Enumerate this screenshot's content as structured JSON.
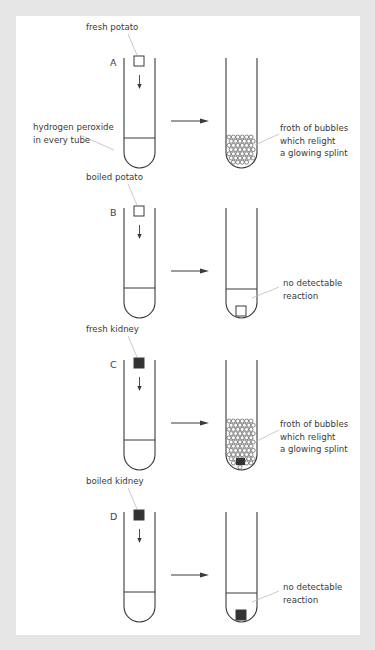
{
  "figure": {
    "background_color": "#e6e6e6",
    "panel_color": "#ffffff",
    "line_color": "#3a3a3a",
    "shared_label": "hydrogen peroxide\nin every tube",
    "rows": [
      {
        "id": "A",
        "letter": "A",
        "sample_label": "fresh potato",
        "sample_fill": "none",
        "result_label": "froth of bubbles\nwhich relight\na glowing splint",
        "result": "froth-small",
        "top": 58
      },
      {
        "id": "B",
        "letter": "B",
        "sample_label": "boiled potato",
        "sample_fill": "none",
        "result_label": "no detectable\nreaction",
        "result": "none",
        "top": 208
      },
      {
        "id": "C",
        "letter": "C",
        "sample_label": "fresh kidney",
        "sample_fill": "#333333",
        "result_label": "froth of bubbles\nwhich relight\na glowing splint",
        "result": "froth-large",
        "top": 360
      },
      {
        "id": "D",
        "letter": "D",
        "sample_label": "boiled kidney",
        "sample_fill": "#333333",
        "result_label": "no detectable\nreaction",
        "result": "none",
        "top": 512
      }
    ]
  }
}
